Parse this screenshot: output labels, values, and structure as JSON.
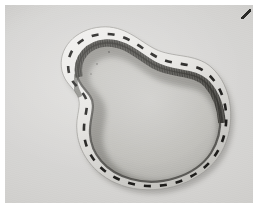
{
  "image": {
    "kind": "photograph",
    "palette": "grayscale",
    "border_color": "#ffffff",
    "background_color": "#d7d6d3",
    "subject": "flexible-banding-strip-bent-into-closed-peanut-shape",
    "caption": "",
    "artifact": "dark-diagonal-nick-top-right-corner"
  },
  "scene": {
    "background": {
      "name": "textured-paper-surface",
      "tone_light": "#e0dfdd",
      "tone_mid": "#d4d3d1",
      "tone_dark": "#c6c5c2"
    },
    "object": {
      "name": "flexible-band",
      "face_color": "#e8e7e4",
      "face_shadow_color": "#a9a8a4",
      "edge_color": "#55544f",
      "inner_wall_color": "#4c4b47",
      "serration": {
        "name": "comb-teeth-inner-wall",
        "visible_on": "upper-inner-edge",
        "tooth_color": "#3a3936",
        "tooth_pitch_px": 1.6
      },
      "marking": {
        "name": "dashed-centreline",
        "color": "#1d1c1a",
        "dash_length_px": 7,
        "gap_length_px": 9,
        "stroke_width_px": 2.6,
        "dash_count": 30
      }
    },
    "interior": {
      "name": "enclosed-inner-field",
      "tone": "#c2c1be",
      "shadow_tone": "#9b9a96"
    },
    "cast_shadow": {
      "name": "drop-shadow-under-band",
      "color": "rgba(60,59,55,0.38)",
      "offset_x_px": 2,
      "offset_y_px": 3
    }
  },
  "geometry": {
    "photo": {
      "x": 5,
      "y": 5,
      "width": 248,
      "height": 198
    },
    "outer_path": "M 57 66 C 52 44, 70 24, 96 22 C 120 20, 134 36, 150 44 C 168 53, 190 48, 206 62 C 228 81, 232 120, 216 148 C 198 178, 156 191, 122 182 C 92 174, 74 150, 72 127 C 70 110, 78 100, 72 90 C 67 81, 60 78, 57 66 Z",
    "inner_path": "M 72 70 C 68 52, 82 38, 100 37 C 120 36, 132 50, 148 59 C 168 70, 188 64, 201 78 C 218 96, 220 126, 206 148 C 190 172, 154 182, 126 174 C 100 167, 86 148, 85 129 C 84 113, 92 101, 85 91 C 79 82, 74 80, 72 70 Z",
    "dash_path": "M 64 68 C 59 46, 76 30, 99 29 C 121 28, 134 42, 150 51 C 169 62, 190 56, 204 70 C 224 89, 227 124, 211 149 C 194 176, 155 187, 124 178 C 96 170, 80 149, 79 128 C 78 111, 86 100, 79 90 C 73 81, 67 79, 64 68 Z"
  }
}
